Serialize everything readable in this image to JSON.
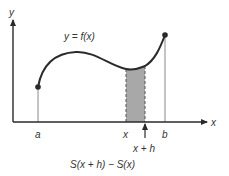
{
  "diagram": {
    "axis_labels": {
      "y": "y",
      "x": "x"
    },
    "curve_label": "y = f(x)",
    "tick_labels": {
      "a": "a",
      "x": "x",
      "x_plus_h": "x + h",
      "b": "b"
    },
    "caption": "S(x + h) − S(x)",
    "colors": {
      "stroke": "#2a2a2a",
      "shade": "#a8a8a8",
      "guide": "#888888"
    }
  }
}
